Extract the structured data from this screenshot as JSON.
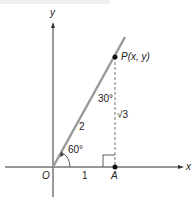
{
  "diagram": {
    "type": "right-triangle-on-axes",
    "axes": {
      "x_label": "x",
      "y_label": "y",
      "origin_label": "O"
    },
    "points": {
      "origin": {
        "label": "O"
      },
      "A": {
        "label": "A"
      },
      "P": {
        "label": "P(x, y)"
      }
    },
    "segments": {
      "OA_length": "1",
      "OP_length": "2",
      "PA_length": "√3"
    },
    "angles": {
      "at_O": "60°",
      "at_P": "30°"
    },
    "colors": {
      "ray": "#9a9a9a",
      "axes": "#333333",
      "dashed": "#555555",
      "points": "#111111"
    }
  }
}
